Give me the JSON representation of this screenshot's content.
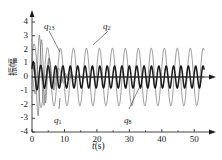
{
  "chart_data": {
    "type": "line",
    "title": "",
    "xlabel": "t (s)",
    "xlabel_symbol": "t",
    "xlabel_unit": "(s)",
    "ylabel": "振幅",
    "xlim": [
      0,
      53
    ],
    "ylim": [
      -4,
      4
    ],
    "xticks": [
      0,
      10,
      20,
      30,
      40,
      50
    ],
    "xtick_labels": [
      "0",
      "10",
      "20",
      "30",
      "40",
      "50"
    ],
    "yticks": [
      4,
      3,
      2,
      1,
      0,
      -1,
      -2,
      -3,
      -4
    ],
    "ytick_labels": [
      "4",
      "3",
      "2",
      "1",
      "0",
      "-1",
      "-2",
      "-3",
      "-4"
    ],
    "grid": false,
    "legend_position": "inline-annotations",
    "series": [
      {
        "name": "q13",
        "label": "q",
        "subscript": "13",
        "color": "#555555",
        "linewidth": 0.6,
        "description": "fast decaying transient, initial peak near 3.4 at t~2.5, damped to zero by t~12",
        "steady_amplitude": 0.0,
        "initial_peak": 3.4,
        "frequency_hz": 0.42,
        "damping": 0.3
      },
      {
        "name": "q2",
        "label": "q",
        "subscript": "2",
        "color": "#555555",
        "linewidth": 0.6,
        "description": "thin large-amplitude steady sinusoid, amplitude ~2.1, period ~4 s",
        "steady_amplitude": 2.1,
        "initial_peak": 2.6,
        "frequency_hz": 0.25,
        "damping": 0.0
      },
      {
        "name": "q1",
        "label": "q",
        "subscript": "1",
        "color": "#555555",
        "linewidth": 0.6,
        "description": "decaying transient dipping to -3.1 near t~5, damped out by t~14",
        "steady_amplitude": 0.0,
        "initial_peak": -3.1,
        "frequency_hz": 0.33,
        "damping": 0.26
      },
      {
        "name": "q8",
        "label": "q",
        "subscript": "8",
        "color": "#1a1a1a",
        "linewidth": 1.5,
        "description": "bold higher-frequency steady sinusoid, amplitude ~0.8, period ~2.3 s",
        "steady_amplitude": 0.8,
        "initial_peak": 1.0,
        "frequency_hz": 0.44,
        "damping": 0.0
      }
    ],
    "annotations": [
      {
        "name": "q13",
        "text": "q",
        "subscript": "13",
        "x_px": 44,
        "y_px": 22,
        "leader_to_x_px": 60,
        "leader_to_y_px": 52
      },
      {
        "name": "q2",
        "text": "q",
        "subscript": "2",
        "x_px": 103,
        "y_px": 22,
        "leader_to_x_px": 93,
        "leader_to_y_px": 45
      },
      {
        "name": "q1",
        "text": "q",
        "subscript": "1",
        "x_px": 54,
        "y_px": 116,
        "leader_to_x_px": 60,
        "leader_to_y_px": 98
      },
      {
        "name": "q8",
        "text": "q",
        "subscript": "8",
        "x_px": 124,
        "y_px": 116,
        "leader_to_x_px": 139,
        "leader_to_y_px": 88
      }
    ],
    "axis_color": "#1a1a1a",
    "background": "#ffffff"
  }
}
